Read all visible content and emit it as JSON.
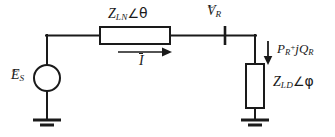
{
  "figure": {
    "background_color": "#ffffff",
    "line_color": "#1a1a1a",
    "text_color": "#1a1a1a"
  },
  "labels": {
    "source": {
      "symbol": "E",
      "accent": "~",
      "subscript": "S",
      "full_text": "ẼS"
    },
    "line_impedance": {
      "symbol": "Z",
      "subscript": "LN",
      "angle_sign": "∠",
      "angle_symbol": "θ",
      "full_text": "ZLN∠θ"
    },
    "current": {
      "symbol": "I",
      "accent": "overline",
      "full_text": "Ī"
    },
    "receiving_voltage": {
      "symbol": "V",
      "accent": "~",
      "subscript": "R",
      "full_text": "ṼR"
    },
    "power": {
      "real_symbol": "P",
      "real_subscript": "R",
      "operator": "+",
      "imag_unit": "j",
      "imag_symbol": "Q",
      "imag_subscript": "R",
      "full_text": "PR + jQR"
    },
    "load_impedance": {
      "symbol": "Z",
      "subscript": "LD",
      "angle_sign": "∠",
      "angle_symbol": "φ",
      "full_text": "ZLD∠φ"
    }
  },
  "components": [
    {
      "name": "voltage-source",
      "type": "circle-source",
      "cx": 47,
      "cy": 78,
      "r": 13
    },
    {
      "name": "line-impedance",
      "type": "rect-impedance",
      "x": 100,
      "y": 27,
      "w": 70,
      "h": 17,
      "orientation": "horizontal"
    },
    {
      "name": "load-impedance",
      "type": "rect-impedance",
      "x": 246,
      "y": 64,
      "w": 18,
      "h": 44,
      "orientation": "vertical"
    },
    {
      "name": "node-marker-vr",
      "type": "node-tick",
      "x": 225,
      "y": 35
    },
    {
      "name": "ground-source",
      "type": "ground",
      "x": 47,
      "y": 118
    },
    {
      "name": "ground-load",
      "type": "ground",
      "x": 255,
      "y": 118
    },
    {
      "name": "current-arrow",
      "type": "arrow",
      "direction": "right",
      "x1": 118,
      "y1": 52,
      "x2": 168,
      "y2": 52
    },
    {
      "name": "power-arrow",
      "type": "arrow",
      "direction": "down",
      "x1": 268,
      "y1": 41,
      "x2": 268,
      "y2": 62
    }
  ]
}
